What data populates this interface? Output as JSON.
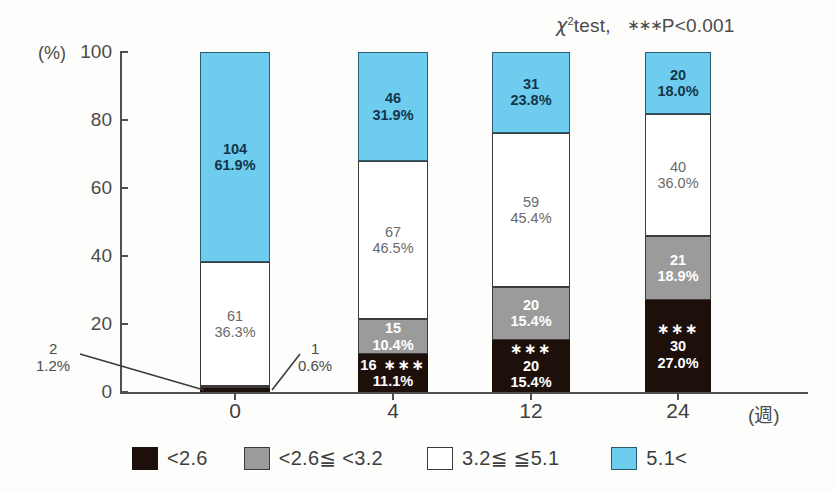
{
  "annotation": {
    "chi": "χ",
    "sup": "2",
    "test": "test,",
    "stars": "∗∗∗",
    "pvalue": "P<0.001"
  },
  "axes": {
    "y_unit": "(%)",
    "y_ticks": [
      "100",
      "80",
      "60",
      "40",
      "20",
      "0"
    ],
    "x_unit": "(週)",
    "x_ticks": [
      "0",
      "4",
      "12",
      "24"
    ]
  },
  "callouts": [
    {
      "name": "week0-black-callout",
      "count": "2",
      "percent": "1.2%"
    },
    {
      "name": "week0-gray-callout",
      "count": "1",
      "percent": "0.6%"
    }
  ],
  "legend": [
    {
      "key": "black",
      "label": "<2.6"
    },
    {
      "key": "gray",
      "label": "<2.6≦ <3.2"
    },
    {
      "key": "white",
      "label": "3.2≦ ≦5.1"
    },
    {
      "key": "blue",
      "label": "5.1<"
    }
  ],
  "colors": {
    "blue": "#6ecdee",
    "gray": "#9b9b9b",
    "white": "#ffffff",
    "black": "#1d100b",
    "axis": "#4f4f4f"
  },
  "chart_data": {
    "type": "bar",
    "title": "",
    "subtitle": "",
    "xlabel": "(週)",
    "ylabel": "(%)",
    "ylim": [
      0,
      100
    ],
    "yticks": [
      0,
      20,
      40,
      60,
      80,
      100
    ],
    "grid": false,
    "legend_position": "bottom",
    "stacked": true,
    "categories": [
      "0",
      "4",
      "12",
      "24"
    ],
    "series": [
      {
        "name": "<2.6",
        "color": "#1d100b",
        "counts": [
          2,
          16,
          20,
          30
        ],
        "values": [
          1.2,
          11.1,
          15.4,
          27.0
        ],
        "labels": [
          "2 / 1.2%",
          "16 / 11.1%",
          "20 / 15.4%",
          "30 / 27.0%"
        ],
        "significance": [
          "",
          "***",
          "***",
          "***"
        ]
      },
      {
        "name": "<2.6≦ <3.2",
        "color": "#9b9b9b",
        "counts": [
          1,
          15,
          20,
          21
        ],
        "values": [
          0.6,
          10.4,
          15.4,
          18.9
        ],
        "labels": [
          "1 / 0.6%",
          "15 / 10.4%",
          "20 / 15.4%",
          "21 / 18.9%"
        ],
        "significance": [
          "",
          "",
          "",
          ""
        ]
      },
      {
        "name": "3.2≦ ≦5.1",
        "color": "#ffffff",
        "counts": [
          61,
          67,
          59,
          40
        ],
        "values": [
          36.3,
          46.5,
          45.4,
          36.0
        ],
        "labels": [
          "61 / 36.3%",
          "67 / 46.5%",
          "59 / 45.4%",
          "40 / 36.0%"
        ],
        "significance": [
          "",
          "",
          "",
          ""
        ]
      },
      {
        "name": "5.1<",
        "color": "#6ecdee",
        "counts": [
          104,
          46,
          31,
          20
        ],
        "values": [
          61.9,
          31.9,
          23.8,
          18.0
        ],
        "labels": [
          "104 / 61.9%",
          "46 / 31.9%",
          "31 / 23.8%",
          "20 / 18.0%"
        ],
        "significance": [
          "",
          "",
          "",
          ""
        ]
      }
    ],
    "annotations": [
      "χ2test, ***P<0.001"
    ]
  },
  "bars": [
    {
      "name": "bar-week-0",
      "segments": [
        {
          "key": "blue",
          "count": "104",
          "percent": "61.9%",
          "stars": ""
        },
        {
          "key": "white",
          "count": "61",
          "percent": "36.3%",
          "stars": ""
        },
        {
          "key": "gray",
          "count": "",
          "percent": "",
          "stars": ""
        },
        {
          "key": "black",
          "count": "",
          "percent": "",
          "stars": ""
        }
      ]
    },
    {
      "name": "bar-week-4",
      "segments": [
        {
          "key": "blue",
          "count": "46",
          "percent": "31.9%",
          "stars": ""
        },
        {
          "key": "white",
          "count": "67",
          "percent": "46.5%",
          "stars": ""
        },
        {
          "key": "gray",
          "count": "15",
          "percent": "10.4%",
          "stars": ""
        },
        {
          "key": "black",
          "count": "16",
          "percent": "11.1%",
          "stars": "∗∗∗"
        }
      ]
    },
    {
      "name": "bar-week-12",
      "segments": [
        {
          "key": "blue",
          "count": "31",
          "percent": "23.8%",
          "stars": ""
        },
        {
          "key": "white",
          "count": "59",
          "percent": "45.4%",
          "stars": ""
        },
        {
          "key": "gray",
          "count": "20",
          "percent": "15.4%",
          "stars": ""
        },
        {
          "key": "black",
          "count": "20",
          "percent": "15.4%",
          "stars": "∗∗∗"
        }
      ]
    },
    {
      "name": "bar-week-24",
      "segments": [
        {
          "key": "blue",
          "count": "20",
          "percent": "18.0%",
          "stars": ""
        },
        {
          "key": "white",
          "count": "40",
          "percent": "36.0%",
          "stars": ""
        },
        {
          "key": "gray",
          "count": "21",
          "percent": "18.9%",
          "stars": ""
        },
        {
          "key": "black",
          "count": "30",
          "percent": "27.0%",
          "stars": "∗∗∗"
        }
      ]
    }
  ]
}
